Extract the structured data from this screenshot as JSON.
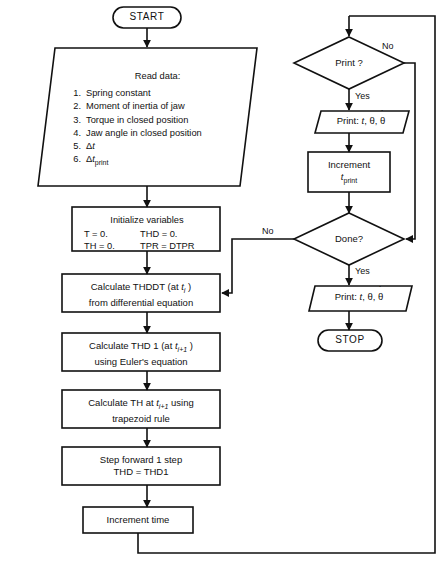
{
  "diagram": {
    "start_label": "START",
    "stop_label": "STOP"
  },
  "read_data": {
    "title": "Read data:",
    "items": [
      {
        "num": "1.",
        "text": "Spring constant"
      },
      {
        "num": "2.",
        "text": "Moment of inertia of jaw"
      },
      {
        "num": "3.",
        "text": "Torque in closed position"
      },
      {
        "num": "4.",
        "text": "Jaw angle in closed position"
      },
      {
        "num": "5.",
        "text": "Δt"
      },
      {
        "num": "6.",
        "text": "Δt print"
      }
    ]
  },
  "initialize": {
    "title": "Initialize variables",
    "row1_left": "T = 0.",
    "row1_right": "THD = 0.",
    "row2_left": "TH = 0.",
    "row2_right": "TPR = DTPR"
  },
  "process": {
    "thddt_line1": "Calculate THDDT (at t i )",
    "thddt_line2": "from differential equation",
    "thd1_line1": "Calculate THD 1 (at t i+1 )",
    "thd1_line2": "using Euler's equation",
    "th_line1": "Calculate TH at t i+1 using",
    "th_line2": "trapezoid rule",
    "step_line1": "Step forward 1 step",
    "step_line2": "THD = THD1",
    "increment_time": "Increment time",
    "increment_tprint_line1": "Increment",
    "increment_tprint_line2": "t print"
  },
  "decisions": {
    "print_question": "Print ?",
    "print_yes": "Yes",
    "print_no": "No",
    "done_question": "Done?",
    "done_yes": "Yes",
    "done_no": "No"
  },
  "output": {
    "print_label": "Print:",
    "print_vars": "t, θ, θ̇"
  },
  "colors": {
    "line": "#111111",
    "background": "#ffffff",
    "text": "#111111"
  }
}
